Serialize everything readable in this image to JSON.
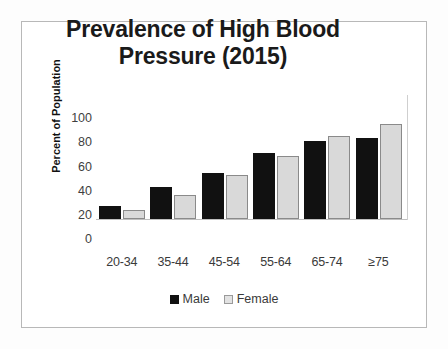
{
  "chart_data": {
    "type": "bar",
    "title": "Prevalence of High Blood Pressure (2015)",
    "title_line1": "Prevalence of High Blood",
    "title_line2": "Pressure (2015)",
    "xlabel": "",
    "ylabel": "Percent of Population",
    "categories": [
      "20-34",
      "35-44",
      "45-54",
      "55-64",
      "65-74",
      "≥75"
    ],
    "series": [
      {
        "name": "Male",
        "color": "#111111",
        "values": [
          11,
          26,
          38,
          54,
          64,
          66
        ]
      },
      {
        "name": "Female",
        "color": "#d9d9d9",
        "values": [
          7,
          20,
          36,
          52,
          68,
          78
        ]
      }
    ],
    "ylim": [
      0,
      100
    ],
    "yticks": [
      100,
      80,
      60,
      40,
      20,
      0
    ],
    "ytick_labels": [
      "100",
      "80",
      "60",
      "40",
      "20",
      "0"
    ],
    "grid": false,
    "legend_position": "bottom"
  },
  "legend": {
    "items": [
      {
        "label": "Male",
        "swatch": "male"
      },
      {
        "label": "Female",
        "swatch": "female"
      }
    ]
  }
}
